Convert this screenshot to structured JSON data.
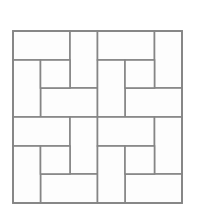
{
  "figure": {
    "background_color": "#ffffff",
    "line_color": "#858585",
    "tile_fill_color": "#fdfdfd",
    "line_width": 1.6
  },
  "geometry": {
    "image_width": 199,
    "image_height": 205,
    "outer_square": {
      "x": 13,
      "y": 31,
      "width": 169,
      "height": 172
    },
    "blocks_across": 2,
    "blocks_down": 2,
    "block_width": 84.5,
    "block_height": 86,
    "unit_short": 28.1,
    "unit_long": 56.3
  },
  "chart_data": {
    "type": "diagram",
    "pattern": "pinwheel",
    "blocks": [
      {
        "name": "block-top-left",
        "origin_x": 13,
        "origin_y": 31,
        "tiles": [
          {
            "name": "top-rect",
            "x": 0,
            "y": 0,
            "w": 57.0,
            "h": 29.0
          },
          {
            "name": "right-rect",
            "x": 57.0,
            "y": 0,
            "w": 27.5,
            "h": 57.0
          },
          {
            "name": "bottom-rect",
            "x": 27.5,
            "y": 57.0,
            "w": 57.0,
            "h": 29.0
          },
          {
            "name": "left-rect",
            "x": 0,
            "y": 29.0,
            "w": 27.5,
            "h": 57.0
          },
          {
            "name": "center-square",
            "x": 27.5,
            "y": 29.0,
            "w": 29.5,
            "h": 28.0
          }
        ]
      },
      {
        "name": "block-top-right",
        "origin_x": 97.5,
        "origin_y": 31,
        "tiles": [
          {
            "name": "top-rect",
            "x": 0,
            "y": 0,
            "w": 57.0,
            "h": 29.0
          },
          {
            "name": "right-rect",
            "x": 57.0,
            "y": 0,
            "w": 27.5,
            "h": 57.0
          },
          {
            "name": "bottom-rect",
            "x": 27.5,
            "y": 57.0,
            "w": 57.0,
            "h": 29.0
          },
          {
            "name": "left-rect",
            "x": 0,
            "y": 29.0,
            "w": 27.5,
            "h": 57.0
          },
          {
            "name": "center-square",
            "x": 27.5,
            "y": 29.0,
            "w": 29.5,
            "h": 28.0
          }
        ]
      },
      {
        "name": "block-bottom-left",
        "origin_x": 13,
        "origin_y": 117,
        "tiles": [
          {
            "name": "top-rect",
            "x": 0,
            "y": 0,
            "w": 57.0,
            "h": 29.0
          },
          {
            "name": "right-rect",
            "x": 57.0,
            "y": 0,
            "w": 27.5,
            "h": 57.0
          },
          {
            "name": "bottom-rect",
            "x": 27.5,
            "y": 57.0,
            "w": 57.0,
            "h": 29.0
          },
          {
            "name": "left-rect",
            "x": 0,
            "y": 29.0,
            "w": 27.5,
            "h": 57.0
          },
          {
            "name": "center-square",
            "x": 27.5,
            "y": 29.0,
            "w": 29.5,
            "h": 28.0
          }
        ]
      },
      {
        "name": "block-bottom-right",
        "origin_x": 97.5,
        "origin_y": 117,
        "tiles": [
          {
            "name": "top-rect",
            "x": 0,
            "y": 0,
            "w": 57.0,
            "h": 29.0
          },
          {
            "name": "right-rect",
            "x": 57.0,
            "y": 0,
            "w": 27.5,
            "h": 57.0
          },
          {
            "name": "bottom-rect",
            "x": 27.5,
            "y": 57.0,
            "w": 57.0,
            "h": 29.0
          },
          {
            "name": "left-rect",
            "x": 0,
            "y": 29.0,
            "w": 27.5,
            "h": 57.0
          },
          {
            "name": "center-square",
            "x": 27.5,
            "y": 29.0,
            "w": 29.5,
            "h": 28.0
          }
        ]
      }
    ]
  }
}
